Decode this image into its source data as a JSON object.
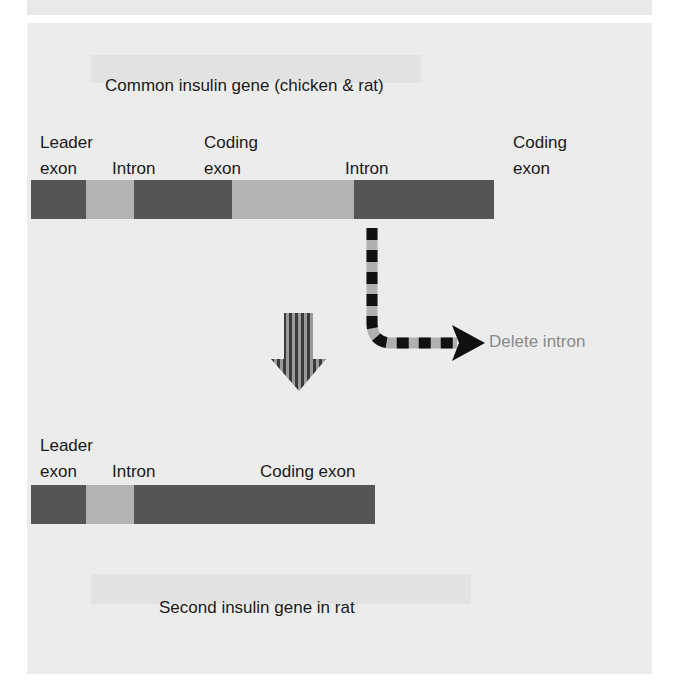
{
  "title_top": "Common insulin gene (chicken & rat)",
  "title_bottom": "Second insulin gene in rat",
  "top_gene": {
    "labels": [
      {
        "line1": "Leader",
        "line2": "exon"
      },
      {
        "line1": "",
        "line2": "Intron"
      },
      {
        "line1": "Coding",
        "line2": "exon"
      },
      {
        "line1": "",
        "line2": "Intron"
      },
      {
        "line1": "Coding",
        "line2": "exon"
      }
    ],
    "segments": [
      {
        "type": "exon",
        "name": "Leader exon",
        "width": 55
      },
      {
        "type": "intron",
        "name": "Intron",
        "width": 48
      },
      {
        "type": "exon",
        "name": "Coding exon",
        "width": 98
      },
      {
        "type": "intron",
        "name": "Intron",
        "width": 122
      },
      {
        "type": "exon",
        "name": "Coding exon",
        "width": 140
      }
    ]
  },
  "bottom_gene": {
    "labels": [
      {
        "line1": "Leader",
        "line2": "exon"
      },
      {
        "line1": "",
        "line2": "Intron"
      },
      {
        "line1": "",
        "line2": "Coding exon"
      }
    ],
    "segments": [
      {
        "type": "exon",
        "name": "Leader exon",
        "width": 55
      },
      {
        "type": "intron",
        "name": "Intron",
        "width": 48
      },
      {
        "type": "exon",
        "name": "Coding exon",
        "width": 241
      }
    ]
  },
  "delete_arrow_label": "Delete intron",
  "colors": {
    "exon": "#555555",
    "intron": "#b3b3b3",
    "panel": "#ececec",
    "label_gray": "#8a8a8a"
  }
}
